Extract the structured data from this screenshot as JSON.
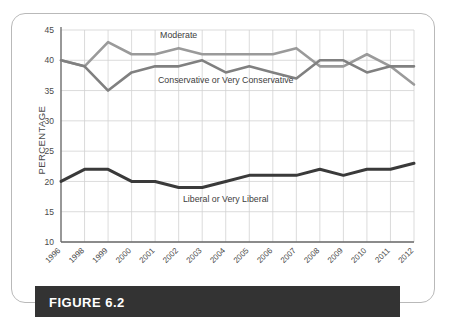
{
  "figure": {
    "caption": "FIGURE 6.2"
  },
  "chart_data": {
    "type": "line",
    "title": "",
    "subtitle": "",
    "xlabel": "",
    "ylabel": "PERCENTAGE",
    "ylim": [
      10,
      45
    ],
    "yticks": [
      10,
      15,
      20,
      25,
      30,
      35,
      40,
      45
    ],
    "grid": true,
    "legend_position": "inline-annotations",
    "categories": [
      "1996",
      "1998",
      "1999",
      "2000",
      "2001",
      "2002",
      "2003",
      "2004",
      "2005",
      "2006",
      "2007",
      "2008",
      "2009",
      "2010",
      "2011",
      "2012"
    ],
    "series": [
      {
        "name": "Moderate",
        "color": "#9a9a9a",
        "values": [
          40,
          39,
          43,
          41,
          41,
          42,
          41,
          41,
          41,
          41,
          42,
          39,
          39,
          41,
          39,
          36
        ]
      },
      {
        "name": "Conservative or Very Conservative",
        "color": "#808080",
        "values": [
          40,
          39,
          35,
          38,
          39,
          39,
          40,
          38,
          39,
          38,
          37,
          40,
          40,
          38,
          39,
          39
        ]
      },
      {
        "name": "Liberal or Very Liberal",
        "color": "#3a3a3a",
        "values": [
          20,
          22,
          22,
          20,
          20,
          19,
          19,
          20,
          21,
          21,
          21,
          22,
          21,
          22,
          22,
          23
        ]
      }
    ],
    "annotations": [
      {
        "text": "Moderate",
        "x": 2002,
        "y": 43.6
      },
      {
        "text": "Conservative or Very Conservative",
        "x": 2004,
        "y": 36.3
      },
      {
        "text": "Liberal or Very Liberal",
        "x": 2004,
        "y": 16.6
      }
    ]
  }
}
